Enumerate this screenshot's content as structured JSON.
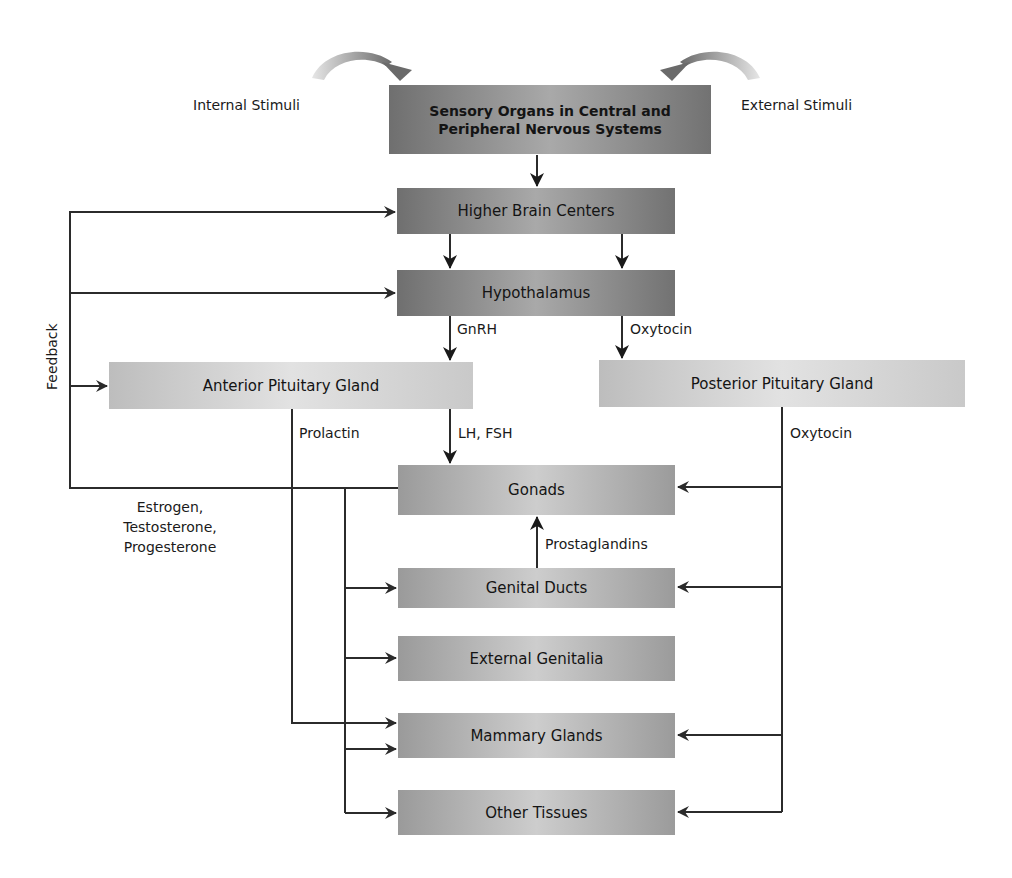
{
  "diagram": {
    "nodes": {
      "sensory": "Sensory Organs in Central and Peripheral Nervous Systems",
      "higher_brain": "Higher Brain Centers",
      "hypothalamus": "Hypothalamus",
      "anterior_pituitary": "Anterior Pituitary Gland",
      "posterior_pituitary": "Posterior Pituitary Gland",
      "gonads": "Gonads",
      "genital_ducts": "Genital Ducts",
      "external_genitalia": "External Genitalia",
      "mammary_glands": "Mammary Glands",
      "other_tissues": "Other Tissues"
    },
    "labels": {
      "internal_stimuli": "Internal Stimuli",
      "external_stimuli": "External Stimuli",
      "feedback": "Feedback",
      "gnrh": "GnRH",
      "oxytocin_hypothalamus": "Oxytocin",
      "prolactin": "Prolactin",
      "lh_fsh": "LH, FSH",
      "oxytocin_posterior": "Oxytocin",
      "sex_hormones": "Estrogen,\nTestosterone,\nProgesterone",
      "prostaglandins": "Prostaglandins"
    },
    "edges": [
      {
        "from": "Internal Stimuli",
        "to": "Sensory Organs in Central and Peripheral Nervous Systems"
      },
      {
        "from": "External Stimuli",
        "to": "Sensory Organs in Central and Peripheral Nervous Systems"
      },
      {
        "from": "Sensory Organs in Central and Peripheral Nervous Systems",
        "to": "Higher Brain Centers"
      },
      {
        "from": "Higher Brain Centers",
        "to": "Hypothalamus"
      },
      {
        "from": "Hypothalamus",
        "to": "Anterior Pituitary Gland",
        "label": "GnRH"
      },
      {
        "from": "Hypothalamus",
        "to": "Posterior Pituitary Gland",
        "label": "Oxytocin"
      },
      {
        "from": "Anterior Pituitary Gland",
        "to": "Gonads",
        "label": "LH, FSH"
      },
      {
        "from": "Anterior Pituitary Gland",
        "to": "Mammary Glands",
        "label": "Prolactin"
      },
      {
        "from": "Posterior Pituitary Gland",
        "to": "Gonads",
        "label": "Oxytocin"
      },
      {
        "from": "Posterior Pituitary Gland",
        "to": "Genital Ducts",
        "label": "Oxytocin"
      },
      {
        "from": "Posterior Pituitary Gland",
        "to": "Mammary Glands",
        "label": "Oxytocin"
      },
      {
        "from": "Posterior Pituitary Gland",
        "to": "Other Tissues",
        "label": "Oxytocin"
      },
      {
        "from": "Genital Ducts",
        "to": "Gonads",
        "label": "Prostaglandins"
      },
      {
        "from": "Gonads",
        "to": "Genital Ducts",
        "label": "Estrogen, Testosterone, Progesterone"
      },
      {
        "from": "Gonads",
        "to": "External Genitalia",
        "label": "Estrogen, Testosterone, Progesterone"
      },
      {
        "from": "Gonads",
        "to": "Mammary Glands",
        "label": "Estrogen, Testosterone, Progesterone"
      },
      {
        "from": "Gonads",
        "to": "Other Tissues",
        "label": "Estrogen, Testosterone, Progesterone"
      },
      {
        "from": "Gonads",
        "to": "Higher Brain Centers",
        "label": "Feedback"
      },
      {
        "from": "Gonads",
        "to": "Hypothalamus",
        "label": "Feedback"
      },
      {
        "from": "Gonads",
        "to": "Anterior Pituitary Gland",
        "label": "Feedback"
      }
    ]
  }
}
